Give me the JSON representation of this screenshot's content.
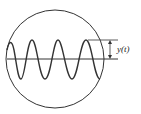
{
  "diagram": {
    "label": "y(t)",
    "colors": {
      "stroke": "#333333",
      "background": "#ffffff"
    }
  }
}
